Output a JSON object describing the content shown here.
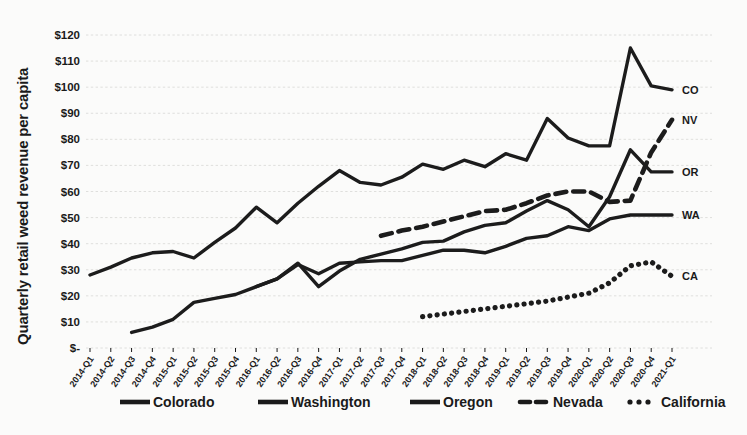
{
  "chart_data": {
    "type": "line",
    "title": "",
    "xlabel": "",
    "ylabel": "Quarterly retail weed revenue per capita",
    "ylim": [
      0,
      120
    ],
    "ytick_labels": [
      "$120",
      "$110",
      "$100",
      "$90",
      "$80",
      "$70",
      "$60",
      "$50",
      "$40",
      "$30",
      "$20",
      "$10",
      "$-"
    ],
    "ytick_values": [
      120,
      110,
      100,
      90,
      80,
      70,
      60,
      50,
      40,
      30,
      20,
      10,
      0
    ],
    "grid": true,
    "legend_position": "bottom",
    "categories": [
      "2014-Q1",
      "2014-Q2",
      "2014-Q3",
      "2014-Q4",
      "2015-Q1",
      "2015-Q2",
      "2015-Q3",
      "2015-Q4",
      "2016-Q1",
      "2016-Q2",
      "2016-Q3",
      "2016-Q4",
      "2017-Q1",
      "2017-Q2",
      "2017-Q3",
      "2017-Q4",
      "2018-Q1",
      "2018-Q2",
      "2018-Q3",
      "2018-Q4",
      "2019-Q1",
      "2019-Q2",
      "2019-Q3",
      "2019-Q4",
      "2020-Q1",
      "2020-Q2",
      "2020-Q3",
      "2020-Q4",
      "2021-Q1"
    ],
    "series": [
      {
        "name": "Colorado",
        "short": "CO",
        "style": "solid",
        "values": [
          28,
          31,
          34.5,
          36.5,
          37,
          34.5,
          40.5,
          46,
          54,
          48,
          55.5,
          62,
          68,
          63.5,
          62.5,
          65.5,
          70.5,
          68.5,
          72,
          69.5,
          74.5,
          72,
          88,
          80.5,
          77.5,
          77.5,
          115,
          100.5,
          99
        ]
      },
      {
        "name": "Washington",
        "short": "WA",
        "style": "solid",
        "values": [
          null,
          null,
          6,
          8,
          11,
          17.5,
          19,
          20.5,
          23.5,
          26.5,
          32,
          28.5,
          32.5,
          33,
          33.5,
          33.5,
          35.5,
          37.5,
          37.5,
          36.5,
          39,
          42,
          43,
          46.5,
          45,
          49.5,
          51,
          51,
          51
        ]
      },
      {
        "name": "Oregon",
        "short": "OR",
        "style": "solid",
        "values": [
          null,
          null,
          null,
          null,
          null,
          null,
          null,
          null,
          23.5,
          26.5,
          32.5,
          23.5,
          29.5,
          34,
          36,
          38,
          40.5,
          41,
          44.5,
          47,
          48,
          52.5,
          56.5,
          53,
          46.5,
          58,
          76,
          67.5,
          67.5
        ]
      },
      {
        "name": "Nevada",
        "short": "NV",
        "style": "dashed",
        "values": [
          null,
          null,
          null,
          null,
          null,
          null,
          null,
          null,
          null,
          null,
          null,
          null,
          null,
          null,
          43,
          45,
          46.5,
          48.5,
          50.5,
          52.5,
          53,
          55.5,
          58.5,
          60,
          60,
          56,
          56.5,
          75,
          87.5
        ]
      },
      {
        "name": "California",
        "short": "CA",
        "style": "dotted",
        "values": [
          null,
          null,
          null,
          null,
          null,
          null,
          null,
          null,
          null,
          null,
          null,
          null,
          null,
          null,
          null,
          null,
          12,
          13,
          14,
          15,
          16,
          17,
          18,
          19.5,
          21,
          25,
          31.5,
          33,
          27.5
        ]
      }
    ],
    "legend": [
      {
        "label": "Colorado",
        "style": "solid"
      },
      {
        "label": "Washington",
        "style": "solid"
      },
      {
        "label": "Oregon",
        "style": "solid"
      },
      {
        "label": "Nevada",
        "style": "dashed"
      },
      {
        "label": "California",
        "style": "dotted"
      }
    ]
  }
}
